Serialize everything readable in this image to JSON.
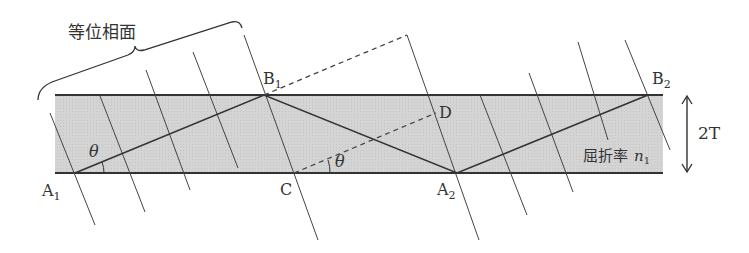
{
  "diagram": {
    "title_label": "等位相面",
    "points": {
      "A1": {
        "label": "A",
        "sub": "1"
      },
      "A2": {
        "label": "A",
        "sub": "2"
      },
      "B1": {
        "label": "B",
        "sub": "1"
      },
      "B2": {
        "label": "B",
        "sub": "2"
      },
      "C": {
        "label": "C"
      },
      "D": {
        "label": "D"
      }
    },
    "angle_label": "θ",
    "thickness_label": "2T",
    "medium_label": "屈折率",
    "index_symbol": "n",
    "index_sub": "1",
    "colors": {
      "band_fill": "#d6d6d6",
      "line": "#333333"
    }
  }
}
